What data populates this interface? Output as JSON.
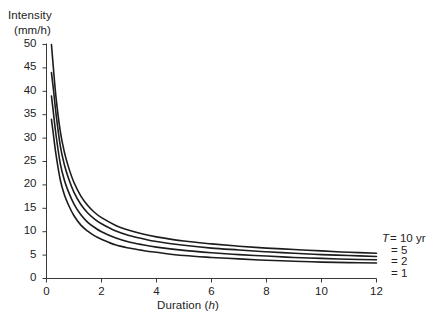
{
  "chart_data": {
    "type": "line",
    "title": "",
    "xlabel": "Duration (h)",
    "xlabel_text": "Duration",
    "xlabel_unit": "h",
    "ylabel": "Intensity (mm/h)",
    "ylabel_line1": "Intensity",
    "ylabel_line2": "(mm/h)",
    "xlim": [
      0,
      12
    ],
    "ylim": [
      0,
      50
    ],
    "xticks": [
      0,
      2,
      4,
      6,
      8,
      10,
      12
    ],
    "xtick_labels": [
      "0",
      "2",
      "4",
      "6",
      "8",
      "10",
      "12"
    ],
    "yticks": [
      0,
      5,
      10,
      15,
      20,
      25,
      30,
      35,
      40,
      45,
      50
    ],
    "ytick_labels": [
      "0",
      "5",
      "10",
      "15",
      "20",
      "25",
      "30",
      "35",
      "40",
      "45",
      "50"
    ],
    "grid": false,
    "legend_position": "right-outside",
    "line_color": "#1c1c1c",
    "axis_color": "#3a3a3a",
    "background": "#ffffff",
    "legend_title_symbol": "T",
    "legend_entries": [
      {
        "label": "T = 10 yr",
        "symbol": "T",
        "equals": "=",
        "value": "10 yr",
        "series": "T10"
      },
      {
        "label": "= 5",
        "symbol": "",
        "equals": "=",
        "value": "5",
        "series": "T5"
      },
      {
        "label": "= 2",
        "symbol": "",
        "equals": "=",
        "value": "2",
        "series": "T2"
      },
      {
        "label": "= 1",
        "symbol": "",
        "equals": "=",
        "value": "1",
        "series": "T1"
      }
    ],
    "x": [
      0.18,
      0.25,
      0.35,
      0.5,
      0.65,
      0.8,
      1.0,
      1.25,
      1.5,
      1.75,
      2.0,
      2.5,
      3.0,
      3.5,
      4.0,
      5.0,
      6.0,
      7.0,
      8.0,
      9.0,
      10.0,
      11.0,
      12.0
    ],
    "series": [
      {
        "name": "T = 10 yr",
        "values": [
          50.0,
          45.0,
          38.5,
          31.5,
          27.0,
          23.8,
          20.5,
          17.6,
          15.6,
          14.1,
          13.0,
          11.4,
          10.3,
          9.5,
          8.9,
          8.0,
          7.4,
          6.9,
          6.5,
          6.2,
          5.9,
          5.6,
          5.4
        ]
      },
      {
        "name": "T = 5",
        "values": [
          44.0,
          40.5,
          35.0,
          28.4,
          24.3,
          21.4,
          18.4,
          15.8,
          14.0,
          12.7,
          11.7,
          10.2,
          9.2,
          8.5,
          7.9,
          7.1,
          6.5,
          6.1,
          5.7,
          5.4,
          5.1,
          4.9,
          4.7
        ]
      },
      {
        "name": "T = 2",
        "values": [
          39.0,
          35.5,
          30.5,
          24.6,
          21.0,
          18.5,
          15.9,
          13.6,
          12.0,
          10.9,
          10.0,
          8.7,
          7.8,
          7.2,
          6.7,
          6.0,
          5.5,
          5.1,
          4.8,
          4.5,
          4.3,
          4.1,
          4.0
        ]
      },
      {
        "name": "T = 1",
        "values": [
          34.0,
          30.8,
          26.3,
          21.1,
          17.9,
          15.7,
          13.4,
          11.4,
          10.1,
          9.1,
          8.4,
          7.2,
          6.5,
          6.0,
          5.6,
          4.9,
          4.5,
          4.2,
          3.9,
          3.7,
          3.5,
          3.4,
          3.3
        ]
      }
    ]
  },
  "figure": {
    "name": "intensity-duration-frequency-curves"
  }
}
